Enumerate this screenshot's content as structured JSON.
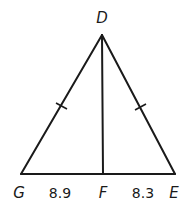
{
  "diagram": {
    "type": "triangle-with-altitude",
    "vertices": {
      "D": {
        "label": "D",
        "x": 102,
        "y": 35
      },
      "G": {
        "label": "G",
        "x": 21,
        "y": 174
      },
      "E": {
        "label": "E",
        "x": 175,
        "y": 174
      },
      "F": {
        "label": "F",
        "x": 103,
        "y": 174
      }
    },
    "segments": [
      {
        "from": "D",
        "to": "G",
        "tick_marks": 1
      },
      {
        "from": "D",
        "to": "E",
        "tick_marks": 1
      },
      {
        "from": "G",
        "to": "E",
        "tick_marks": 0
      },
      {
        "from": "D",
        "to": "F",
        "tick_marks": 0
      }
    ],
    "measurements": {
      "GF": "8.9",
      "FE": "8.3"
    },
    "labels": {
      "D": "D",
      "G": "G",
      "F": "F",
      "E": "E",
      "GF": "8.9",
      "FE": "8.3"
    },
    "congruent_sides": [
      "DG",
      "DE"
    ],
    "colors": {
      "stroke": "#1a1a1a",
      "background": "#ffffff"
    }
  }
}
